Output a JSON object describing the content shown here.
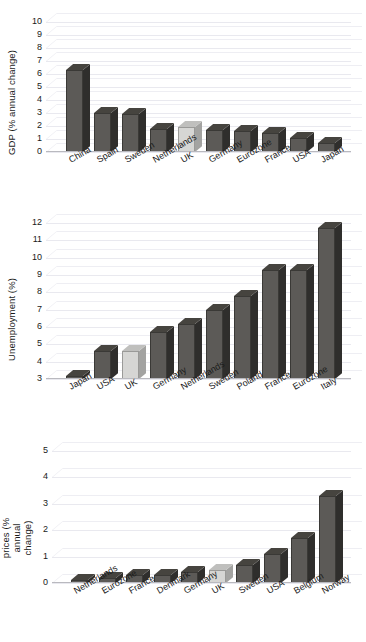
{
  "chart_data": [
    {
      "type": "bar",
      "name": "gdp",
      "title": "",
      "ylabel": "GDP (% annual change)",
      "xlabel": "",
      "ylim": [
        0,
        10
      ],
      "yticks": [
        0,
        1,
        2,
        3,
        4,
        5,
        6,
        7,
        8,
        9,
        10
      ],
      "ytick_labels": [
        "0",
        "1",
        "2",
        "3",
        "4",
        "5",
        "6",
        "7",
        "8",
        "9",
        "10"
      ],
      "grid": true,
      "legend": "none",
      "highlight_category": "UK",
      "highlight_color": "#d6d6d4",
      "bar_color": "#5c5a57",
      "categories": [
        "China",
        "Spain",
        "Sweden",
        "Netherlands",
        "UK",
        "Germany",
        "Eurozone",
        "France",
        "USA",
        "Japan"
      ],
      "values": [
        6.3,
        3.0,
        2.9,
        1.8,
        1.9,
        1.7,
        1.6,
        1.5,
        1.1,
        0.7
      ]
    },
    {
      "type": "bar",
      "name": "unemployment",
      "title": "",
      "ylabel": "Unemployment (%)",
      "xlabel": "",
      "ylim": [
        3,
        12
      ],
      "yticks": [
        3,
        4,
        5,
        6,
        7,
        8,
        9,
        10,
        11,
        12
      ],
      "ytick_labels": [
        "3",
        "4",
        "5",
        "6",
        "7",
        "8",
        "9",
        "10",
        "11",
        "12"
      ],
      "grid": true,
      "legend": "none",
      "highlight_category": "UK",
      "highlight_color": "#d6d6d4",
      "bar_color": "#5c5a57",
      "categories": [
        "Japan",
        "USA",
        "UK",
        "Germany",
        "Netherlands",
        "Sweden",
        "Poland",
        "France",
        "Eurozone",
        "Italy"
      ],
      "values": [
        3.1,
        4.6,
        4.6,
        5.7,
        6.2,
        7.0,
        7.8,
        9.3,
        9.3,
        11.7
      ]
    },
    {
      "type": "bar",
      "name": "consumer-prices",
      "title": "",
      "ylabel": "Consumer prices (% annual change)",
      "xlabel": "",
      "ylim": [
        0,
        5
      ],
      "yticks": [
        0,
        1,
        2,
        3,
        4,
        5
      ],
      "ytick_labels": [
        "0",
        "1",
        "2",
        "3",
        "4",
        "5"
      ],
      "grid": true,
      "legend": "none",
      "highlight_category": "UK",
      "highlight_color": "#d6d6d4",
      "bar_color": "#5c5a57",
      "categories": [
        "Netherlands",
        "Eurozone",
        "France",
        "Denmark",
        "Germany",
        "UK",
        "Sweden",
        "USA",
        "Belgium",
        "Norway"
      ],
      "values": [
        0.1,
        0.2,
        0.3,
        0.3,
        0.4,
        0.5,
        0.7,
        1.1,
        1.7,
        3.3
      ]
    }
  ]
}
